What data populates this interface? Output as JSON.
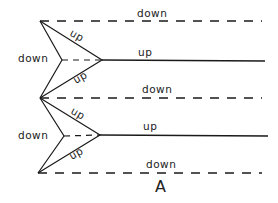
{
  "diagram": {
    "caption": "A",
    "labels": {
      "top_dashed": "down",
      "upper_left": "down",
      "upper_diag_top": "up",
      "upper_diag_bottom": "up",
      "upper_solid": "up",
      "middle_dashed": "down",
      "lower_left": "down",
      "lower_diag_top": "up",
      "lower_diag_bottom": "up",
      "lower_solid": "up",
      "bottom_dashed": "down"
    },
    "colors": {
      "stroke": "#1a1a1a",
      "background": "#ffffff"
    }
  }
}
